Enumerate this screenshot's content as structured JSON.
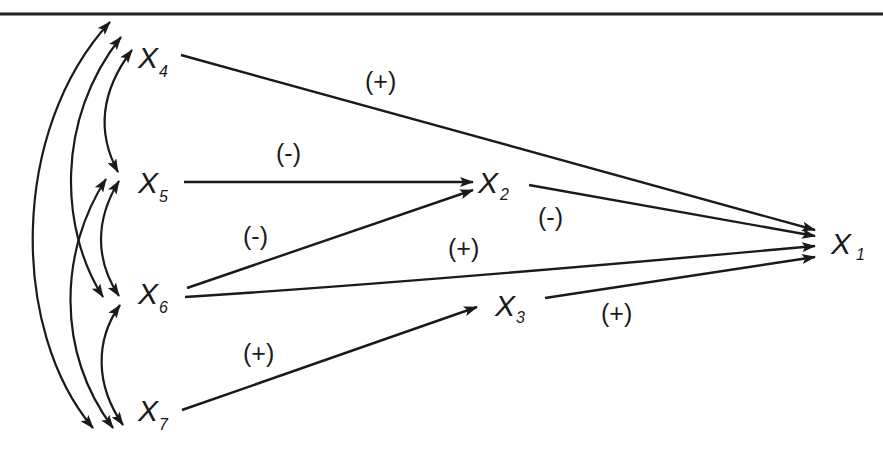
{
  "diagram": {
    "type": "path-diagram",
    "nodes": [
      {
        "id": "X1",
        "label": "X",
        "sub": "1",
        "x": 833,
        "y": 243
      },
      {
        "id": "X2",
        "label": "X",
        "sub": "2",
        "x": 480,
        "y": 183
      },
      {
        "id": "X3",
        "label": "X",
        "sub": "3",
        "x": 497,
        "y": 305
      },
      {
        "id": "X4",
        "label": "X",
        "sub": "4",
        "x": 140,
        "y": 57
      },
      {
        "id": "X5",
        "label": "X",
        "sub": "5",
        "x": 140,
        "y": 182
      },
      {
        "id": "X6",
        "label": "X",
        "sub": "6",
        "x": 140,
        "y": 293
      },
      {
        "id": "X7",
        "label": "X",
        "sub": "7",
        "x": 140,
        "y": 410
      }
    ],
    "edges": [
      {
        "from": "X4",
        "to": "X1",
        "sign": "(+)"
      },
      {
        "from": "X5",
        "to": "X2",
        "sign": "(-)"
      },
      {
        "from": "X6",
        "to": "X2",
        "sign": "(-)"
      },
      {
        "from": "X2",
        "to": "X1",
        "sign": "(-)"
      },
      {
        "from": "X6",
        "to": "X1",
        "sign": "(+)"
      },
      {
        "from": "X7",
        "to": "X3",
        "sign": "(+)"
      },
      {
        "from": "X3",
        "to": "X1",
        "sign": "(+)"
      }
    ],
    "correlations": [
      [
        "X4",
        "X5"
      ],
      [
        "X4",
        "X6"
      ],
      [
        "X4",
        "X7"
      ],
      [
        "X5",
        "X6"
      ],
      [
        "X5",
        "X7"
      ],
      [
        "X6",
        "X7"
      ]
    ],
    "labels": {
      "x4_x1": "(+)",
      "x5_x2": "(-)",
      "x6_x2": "(-)",
      "x2_x1": "(-)",
      "x6_x1": "(+)",
      "x7_x3": "(+)",
      "x3_x1": "(+)"
    },
    "node_text": {
      "x1": {
        "main": "X",
        "sub": "1"
      },
      "x2": {
        "main": "X",
        "sub": "2"
      },
      "x3": {
        "main": "X",
        "sub": "3"
      },
      "x4": {
        "main": "X",
        "sub": "4"
      },
      "x5": {
        "main": "X",
        "sub": "5"
      },
      "x6": {
        "main": "X",
        "sub": "6"
      },
      "x7": {
        "main": "X",
        "sub": "7"
      }
    },
    "colors": {
      "ink": "#1a1a1a",
      "background": "#ffffff"
    }
  }
}
